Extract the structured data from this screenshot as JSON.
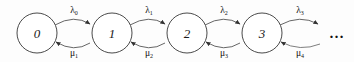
{
  "figure": {
    "kind": "birth-death-process-state-transition-diagram",
    "background_color": "#fdfdfd",
    "stroke_color": "#555555",
    "node_stroke_color": "#4a4a4a",
    "text_color": "#111111",
    "continuation_symbol": "…"
  },
  "states": [
    {
      "label": "0",
      "cx": 37,
      "cy": 33,
      "r": 20
    },
    {
      "label": "1",
      "cx": 112,
      "cy": 33,
      "r": 20
    },
    {
      "label": "2",
      "cx": 187,
      "cy": 33,
      "r": 20
    },
    {
      "label": "3",
      "cx": 262,
      "cy": 33,
      "r": 20
    }
  ],
  "forward_transitions": [
    {
      "label": "λ",
      "subscript": "0",
      "from": "0",
      "to": "1",
      "label_x": 74,
      "label_y": 11
    },
    {
      "label": "λ",
      "subscript": "1",
      "from": "1",
      "to": "2",
      "label_x": 149,
      "label_y": 11
    },
    {
      "label": "λ",
      "subscript": "2",
      "from": "2",
      "to": "3",
      "label_x": 224,
      "label_y": 11
    },
    {
      "label": "λ",
      "subscript": "3",
      "from": "3",
      "to": "…",
      "label_x": 300,
      "label_y": 11
    }
  ],
  "backward_transitions": [
    {
      "label": "μ",
      "subscript": "1",
      "from": "1",
      "to": "0",
      "label_x": 74,
      "label_y": 54
    },
    {
      "label": "μ",
      "subscript": "2",
      "from": "2",
      "to": "1",
      "label_x": 149,
      "label_y": 54
    },
    {
      "label": "μ",
      "subscript": "3",
      "from": "3",
      "to": "2",
      "label_x": 224,
      "label_y": 54
    },
    {
      "label": "μ",
      "subscript": "4",
      "from": "…",
      "to": "3",
      "label_x": 300,
      "label_y": 54
    }
  ],
  "ellipsis": {
    "text": "…",
    "x": 337,
    "y": 33
  }
}
